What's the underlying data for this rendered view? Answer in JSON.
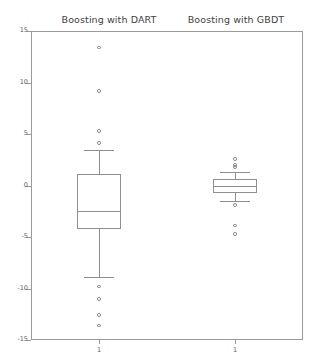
{
  "chart_data": {
    "type": "box",
    "title": "",
    "xlabel": "",
    "ylabel": "",
    "ylim": [
      -15.0,
      15.0
    ],
    "yticks": [
      15,
      10,
      5,
      0,
      -5,
      -10,
      -15
    ],
    "ytick_labels": [
      "15",
      "10",
      "5",
      "0",
      "-5",
      "-10",
      "-15"
    ],
    "grid": false,
    "legend": null,
    "panels": [
      {
        "title": "Boosting with DART",
        "xtick_label": "1",
        "box": {
          "whisker_low": -8.9,
          "q1": -4.2,
          "median": -2.5,
          "q3": 1.1,
          "whisker_high": 3.4
        },
        "outliers": [
          13.4,
          9.2,
          5.3,
          4.1,
          -9.8,
          -11.0,
          -12.6,
          -13.6
        ]
      },
      {
        "title": "Boosting with GBDT",
        "xtick_label": "1",
        "box": {
          "whisker_low": -1.5,
          "q1": -0.7,
          "median": 0.0,
          "q3": 0.6,
          "whisker_high": 1.3
        },
        "outliers": [
          2.6,
          2.0,
          1.8,
          -1.9,
          -3.9,
          -4.7
        ]
      }
    ]
  },
  "axes": {
    "y_axis_name": "value-axis",
    "x_axis_name": "group-axis"
  }
}
